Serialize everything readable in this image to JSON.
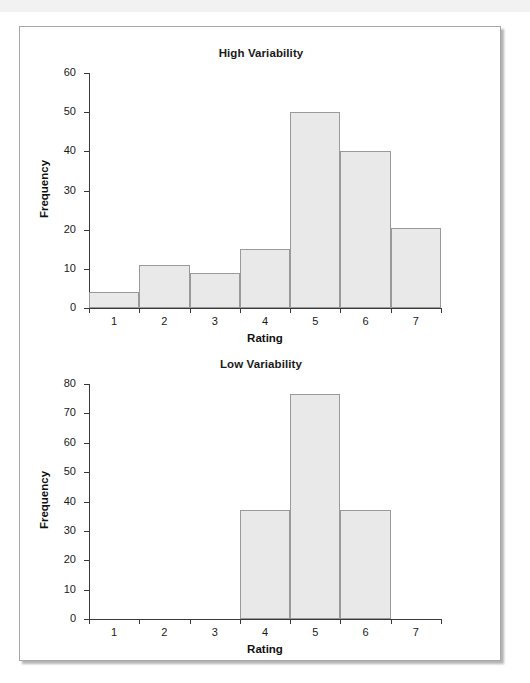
{
  "page": {
    "running_head": "",
    "background_color": "#ffffff",
    "card_border_color": "#a8a8a8"
  },
  "style": {
    "bar_fill": "#e9e9e9",
    "bar_stroke": "#9a9a9a",
    "axis_color": "#3a3a3a",
    "text_color": "#1a1a1a"
  },
  "charts": [
    {
      "title": "High Variability",
      "xlabel": "Rating",
      "ylabel": "Frequency"
    },
    {
      "title": "Low Variability",
      "xlabel": "Rating",
      "ylabel": "Frequency"
    }
  ],
  "chart_data": [
    {
      "type": "bar",
      "title": "High Variability",
      "xlabel": "Rating",
      "ylabel": "Frequency",
      "categories": [
        "1",
        "2",
        "3",
        "4",
        "5",
        "6",
        "7"
      ],
      "values": [
        4,
        11,
        9,
        15,
        50,
        40,
        20.5
      ],
      "xlim": [
        0.5,
        7.5
      ],
      "ylim": [
        0,
        60
      ],
      "yticks": [
        0,
        10,
        20,
        30,
        40,
        50,
        60
      ],
      "xticks": [
        "1",
        "2",
        "3",
        "4",
        "5",
        "6",
        "7"
      ],
      "grid": false,
      "legend": null
    },
    {
      "type": "bar",
      "title": "Low Variability",
      "xlabel": "Rating",
      "ylabel": "Frequency",
      "categories": [
        "1",
        "2",
        "3",
        "4",
        "5",
        "6",
        "7"
      ],
      "values": [
        0,
        0,
        0,
        37,
        76.5,
        37,
        0
      ],
      "xlim": [
        0.5,
        7.5
      ],
      "ylim": [
        0,
        80
      ],
      "yticks": [
        0,
        10,
        20,
        30,
        40,
        50,
        60,
        70,
        80
      ],
      "xticks": [
        "1",
        "2",
        "3",
        "4",
        "5",
        "6",
        "7"
      ],
      "grid": false,
      "legend": null
    }
  ]
}
